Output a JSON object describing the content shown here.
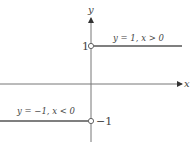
{
  "diagram": {
    "type": "piecewise-function-graph",
    "axes": {
      "x_label": "x",
      "y_label": "y"
    },
    "tick_labels": {
      "positive": "1",
      "negative": "−1"
    },
    "pieces": [
      {
        "label": "y = 1, x > 0",
        "y": 1,
        "domain": "x > 0",
        "endpoint": "open"
      },
      {
        "label": "y = −1, x < 0",
        "y": -1,
        "domain": "x < 0",
        "endpoint": "open"
      }
    ],
    "colors": {
      "axis": "#777777",
      "line": "#555555",
      "text": "#444444"
    }
  }
}
